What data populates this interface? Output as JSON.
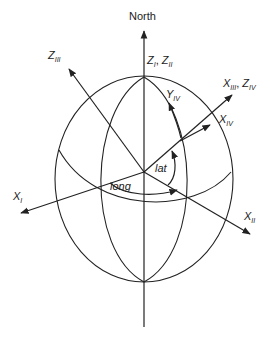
{
  "colors": {
    "stroke": "#222222",
    "background": "#ffffff"
  },
  "labels": {
    "north": "North",
    "z_i_z_ii": {
      "main1": "Z",
      "sub1": "I",
      "sep": ", ",
      "main2": "Z",
      "sub2": "II"
    },
    "z_iii": {
      "main": "Z",
      "sub": "III"
    },
    "x_iii_z_iv": {
      "main1": "X",
      "sub1": "III",
      "sep": ", ",
      "main2": "Z",
      "sub2": "IV"
    },
    "x_iv": {
      "main": "X",
      "sub": "IV"
    },
    "y_iv": {
      "main": "Y",
      "sub": "IV"
    },
    "x_i": {
      "main": "X",
      "sub": "I"
    },
    "x_ii": {
      "main": "X",
      "sub": "II"
    },
    "lat": "lat",
    "long": "long"
  }
}
